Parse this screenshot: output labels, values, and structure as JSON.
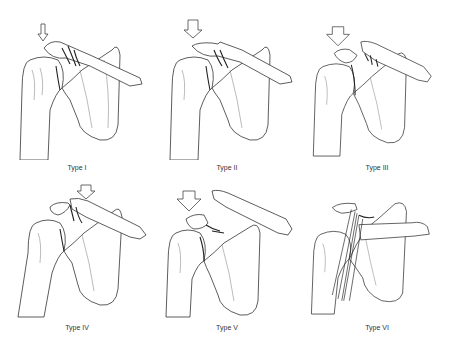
{
  "figure": {
    "panels": [
      {
        "id": "type-1",
        "label": "Type I",
        "arrow": "small",
        "clavicle_displacement": "none"
      },
      {
        "id": "type-2",
        "label": "Type II",
        "arrow": "medium",
        "clavicle_displacement": "slight"
      },
      {
        "id": "type-3",
        "label": "Type III",
        "arrow": "large",
        "clavicle_displacement": "superior"
      },
      {
        "id": "type-4",
        "label": "Type IV",
        "arrow": "medium",
        "clavicle_displacement": "posterior"
      },
      {
        "id": "type-5",
        "label": "Type V",
        "arrow": "large",
        "clavicle_displacement": "marked superior"
      },
      {
        "id": "type-6",
        "label": "Type VI",
        "arrow": "none",
        "clavicle_displacement": "inferior"
      }
    ]
  }
}
